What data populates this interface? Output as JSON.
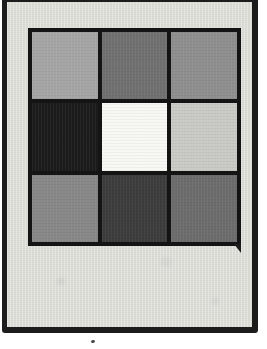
{
  "figure": {
    "type": "gray-patch-grid",
    "page_background": "#ffffff",
    "frame": {
      "border_color": "#1c1c1c",
      "background": "#dcdcd7"
    },
    "grid": {
      "rows": 3,
      "cols": 3,
      "line_color": "#141414",
      "cells": [
        {
          "id": "r1c1",
          "row": 1,
          "col": 1,
          "shade": "#a4a4a4",
          "tone": "light-gray"
        },
        {
          "id": "r1c2",
          "row": 1,
          "col": 2,
          "shade": "#707070",
          "tone": "medium-dark-gray"
        },
        {
          "id": "r1c3",
          "row": 1,
          "col": 3,
          "shade": "#8e8e8e",
          "tone": "medium-gray"
        },
        {
          "id": "r2c1",
          "row": 2,
          "col": 1,
          "shade": "#1b1b1b",
          "tone": "near-black"
        },
        {
          "id": "r2c2",
          "row": 2,
          "col": 2,
          "shade": "#f7f7f3",
          "tone": "white"
        },
        {
          "id": "r2c3",
          "row": 2,
          "col": 3,
          "shade": "#c9c9c6",
          "tone": "very-light-gray"
        },
        {
          "id": "r3c1",
          "row": 3,
          "col": 1,
          "shade": "#878787",
          "tone": "medium-gray"
        },
        {
          "id": "r3c2",
          "row": 3,
          "col": 2,
          "shade": "#3c3c3c",
          "tone": "dark-gray"
        },
        {
          "id": "r3c3",
          "row": 3,
          "col": 3,
          "shade": "#6c6c6c",
          "tone": "medium-dark-gray"
        }
      ]
    },
    "marks": {
      "ink_drip_color": "#1c1c1c",
      "ink_speck_color": "#4a4a4a"
    }
  }
}
